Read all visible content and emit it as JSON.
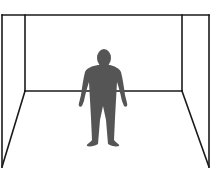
{
  "diagram": {
    "type": "room-perspective-with-figure",
    "colors": {
      "background": "#ffffff",
      "lines": "#1a1a1a",
      "figure": "#555555"
    },
    "room": {
      "outer_top_y": 15,
      "outer_left_x": 2,
      "outer_right_x": 209,
      "inner_left_x": 25,
      "inner_right_x": 182,
      "back_floor_y": 91,
      "front_floor_y": 167
    },
    "figure": {
      "description": "gray human silhouette standing in room center",
      "center_x": 104
    }
  }
}
